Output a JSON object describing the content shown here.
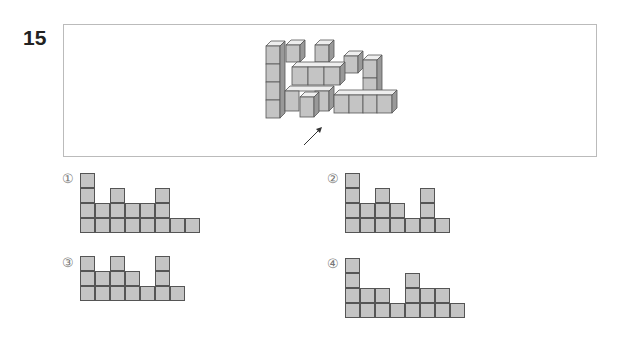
{
  "question": {
    "number": "15"
  },
  "figure": {
    "arrow_icon": "arrow-up-right",
    "cube_color": "#c4c4c4",
    "edge_color": "#555555"
  },
  "options": [
    {
      "label": "①",
      "column_heights": [
        4,
        2,
        3,
        2,
        2,
        3,
        1,
        1
      ]
    },
    {
      "label": "②",
      "column_heights": [
        4,
        2,
        3,
        2,
        1,
        3,
        1
      ]
    },
    {
      "label": "③",
      "column_heights": [
        3,
        2,
        3,
        2,
        1,
        3,
        1
      ]
    },
    {
      "label": "④",
      "column_heights": [
        4,
        2,
        2,
        1,
        3,
        2,
        2,
        1
      ]
    }
  ]
}
